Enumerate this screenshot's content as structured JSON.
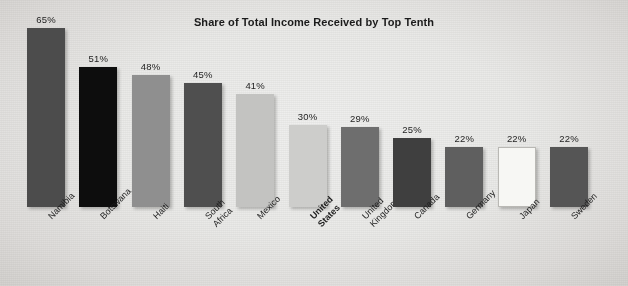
{
  "chart_data": {
    "type": "bar",
    "title": "Share of Total Income Received by Top Tenth",
    "xlabel": "",
    "ylabel": "",
    "ylim": [
      0,
      65
    ],
    "grid": false,
    "legend": "none",
    "value_suffix": "%",
    "categories": [
      "Namibia",
      "Botswana",
      "Haiti",
      "South Africa",
      "Mexico",
      "United States",
      "United Kingdom",
      "Canada",
      "Germany",
      "Japan",
      "Sweden"
    ],
    "values": [
      65,
      51,
      48,
      45,
      41,
      30,
      29,
      25,
      22,
      22,
      22
    ],
    "value_labels": [
      "65%",
      "51%",
      "48%",
      "45%",
      "41%",
      "30%",
      "29%",
      "25%",
      "22%",
      "22%",
      "22%"
    ],
    "bar_colors": [
      "#4c4c4c",
      "#0d0d0d",
      "#8f8f8f",
      "#4f4f4f",
      "#c3c3c1",
      "#cdcdcb",
      "#6e6e6e",
      "#3f3f3f",
      "#5f5f5f",
      "#f7f7f4",
      "#555555"
    ],
    "highlighted_category": "United States",
    "background_color": "#e9e9e7",
    "text_color": "#1b1b1b"
  }
}
